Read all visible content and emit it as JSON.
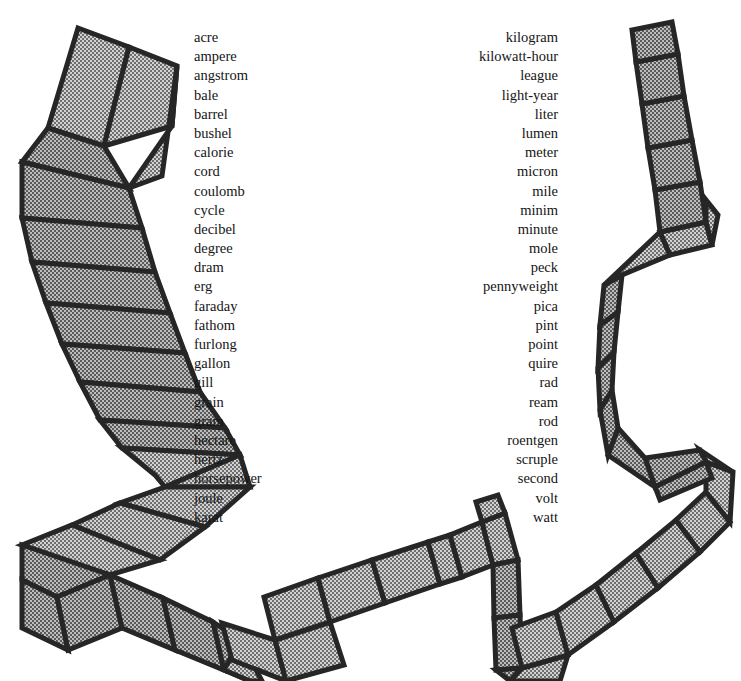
{
  "page": {
    "width": 741,
    "height": 681,
    "background_color": "#ffffff",
    "text_color": "#151515"
  },
  "ribbon": {
    "name": "segmented-path-border",
    "outline_color": "#262626",
    "fill_color": "#b4b4b4",
    "fill_pattern": "stipple-crosshatch",
    "outline_width_px": 5,
    "segment_divider_width_px": 2,
    "description": "Decorative board-game style segmented ribbon path forming a horseshoe around the two word columns",
    "segment_count": 58
  },
  "left_column": {
    "name": "units-left-column",
    "align": "left",
    "items": [
      "acre",
      "ampere",
      "angstrom",
      "bale",
      "barrel",
      "bushel",
      "calorie",
      "cord",
      "coulomb",
      "cycle",
      "decibel",
      "degree",
      "dram",
      "erg",
      "faraday",
      "fathom",
      "furlong",
      "gallon",
      "gill",
      "grain",
      "gram",
      "hectare",
      "hertz",
      "horsepower",
      "joule",
      "karat"
    ]
  },
  "right_column": {
    "name": "units-right-column",
    "align": "right",
    "items": [
      "kilogram",
      "kilowatt-hour",
      "league",
      "light-year",
      "liter",
      "lumen",
      "meter",
      "micron",
      "mile",
      "minim",
      "minute",
      "mole",
      "peck",
      "pennyweight",
      "pica",
      "pint",
      "point",
      "quire",
      "rad",
      "ream",
      "rod",
      "roentgen",
      "scruple",
      "second",
      "volt",
      "watt"
    ]
  }
}
